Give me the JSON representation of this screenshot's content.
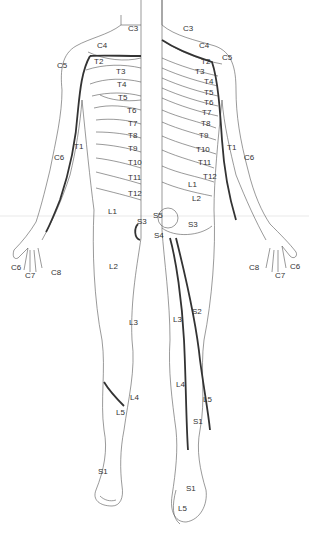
{
  "diagram": {
    "colors": {
      "background": "#ffffff",
      "line": "#555555",
      "thick_line": "#333333",
      "text": "#333333",
      "divider": "#dddddd"
    },
    "labels": [
      {
        "id": "l-c3",
        "text": "C3",
        "x": 128,
        "y": 29
      },
      {
        "id": "r-c3",
        "text": "C3",
        "x": 183,
        "y": 29
      },
      {
        "id": "l-c4",
        "text": "C4",
        "x": 97,
        "y": 46
      },
      {
        "id": "r-c4",
        "text": "C4",
        "x": 199,
        "y": 46
      },
      {
        "id": "l-c5",
        "text": "C5",
        "x": 57,
        "y": 66
      },
      {
        "id": "r-c5",
        "text": "C5",
        "x": 222,
        "y": 58
      },
      {
        "id": "l-t2",
        "text": "T2",
        "x": 94,
        "y": 62
      },
      {
        "id": "r-t2",
        "text": "T2",
        "x": 201,
        "y": 62
      },
      {
        "id": "l-t3",
        "text": "T3",
        "x": 116,
        "y": 72
      },
      {
        "id": "r-t3",
        "text": "T3",
        "x": 195,
        "y": 72
      },
      {
        "id": "l-t4",
        "text": "T4",
        "x": 117,
        "y": 85
      },
      {
        "id": "r-t4",
        "text": "T4",
        "x": 204,
        "y": 82
      },
      {
        "id": "l-t5",
        "text": "T5",
        "x": 118,
        "y": 98
      },
      {
        "id": "r-t5",
        "text": "T5",
        "x": 204,
        "y": 93
      },
      {
        "id": "r-t6",
        "text": "T6",
        "x": 204,
        "y": 103
      },
      {
        "id": "l-t6",
        "text": "T6",
        "x": 127,
        "y": 111
      },
      {
        "id": "r-t7",
        "text": "T7",
        "x": 202,
        "y": 113
      },
      {
        "id": "l-t7",
        "text": "T7",
        "x": 128,
        "y": 124
      },
      {
        "id": "r-t8",
        "text": "T8",
        "x": 201,
        "y": 124
      },
      {
        "id": "l-t8",
        "text": "T8",
        "x": 128,
        "y": 136
      },
      {
        "id": "r-t9",
        "text": "T9",
        "x": 199,
        "y": 136
      },
      {
        "id": "l-t9",
        "text": "T9",
        "x": 128,
        "y": 149
      },
      {
        "id": "r-t10",
        "text": "T10",
        "x": 196,
        "y": 150
      },
      {
        "id": "l-t10",
        "text": "T10",
        "x": 128,
        "y": 163
      },
      {
        "id": "r-t11",
        "text": "T11",
        "x": 198,
        "y": 163
      },
      {
        "id": "l-t11",
        "text": "T11",
        "x": 128,
        "y": 178
      },
      {
        "id": "r-t12",
        "text": "T12",
        "x": 203,
        "y": 177
      },
      {
        "id": "l-t12",
        "text": "T12",
        "x": 128,
        "y": 194
      },
      {
        "id": "r-l1",
        "text": "L1",
        "x": 188,
        "y": 185
      },
      {
        "id": "r-l2",
        "text": "L2",
        "x": 192,
        "y": 199
      },
      {
        "id": "l-l1",
        "text": "L1",
        "x": 108,
        "y": 212
      },
      {
        "id": "l-t1",
        "text": "T1",
        "x": 74,
        "y": 147
      },
      {
        "id": "r-t1",
        "text": "T1",
        "x": 227,
        "y": 148
      },
      {
        "id": "l-c6",
        "text": "C6",
        "x": 54,
        "y": 158
      },
      {
        "id": "r-c6",
        "text": "C6",
        "x": 244,
        "y": 158
      },
      {
        "id": "c-s5",
        "text": "S5",
        "x": 153,
        "y": 216
      },
      {
        "id": "l-s3",
        "text": "S3",
        "x": 137,
        "y": 222
      },
      {
        "id": "r-s3",
        "text": "S3",
        "x": 188,
        "y": 225
      },
      {
        "id": "c-s4",
        "text": "S4",
        "x": 154,
        "y": 236
      },
      {
        "id": "l-l2",
        "text": "L2",
        "x": 109,
        "y": 267
      },
      {
        "id": "l-c6-hand",
        "text": "C6",
        "x": 11,
        "y": 268
      },
      {
        "id": "l-c7-hand",
        "text": "C7",
        "x": 25,
        "y": 276
      },
      {
        "id": "l-c8-hand",
        "text": "C8",
        "x": 51,
        "y": 273
      },
      {
        "id": "r-c6-hand",
        "text": "C6",
        "x": 290,
        "y": 267
      },
      {
        "id": "r-c8-hand",
        "text": "C8",
        "x": 249,
        "y": 268
      },
      {
        "id": "r-c7-hand",
        "text": "C7",
        "x": 275,
        "y": 276
      },
      {
        "id": "r-s2",
        "text": "S2",
        "x": 192,
        "y": 312
      },
      {
        "id": "l-l3",
        "text": "L3",
        "x": 129,
        "y": 323
      },
      {
        "id": "r-l3",
        "text": "L3",
        "x": 173,
        "y": 320
      },
      {
        "id": "r-l4",
        "text": "L4",
        "x": 176,
        "y": 385
      },
      {
        "id": "l-l4",
        "text": "L4",
        "x": 130,
        "y": 398
      },
      {
        "id": "r-l5",
        "text": "L5",
        "x": 203,
        "y": 400
      },
      {
        "id": "l-l5",
        "text": "L5",
        "x": 116,
        "y": 413
      },
      {
        "id": "r-s1",
        "text": "S1",
        "x": 193,
        "y": 422
      },
      {
        "id": "l-s1",
        "text": "S1",
        "x": 98,
        "y": 472
      },
      {
        "id": "r-s1-foot",
        "text": "S1",
        "x": 186,
        "y": 489
      },
      {
        "id": "r-l5-foot",
        "text": "L5",
        "x": 178,
        "y": 509
      }
    ]
  }
}
